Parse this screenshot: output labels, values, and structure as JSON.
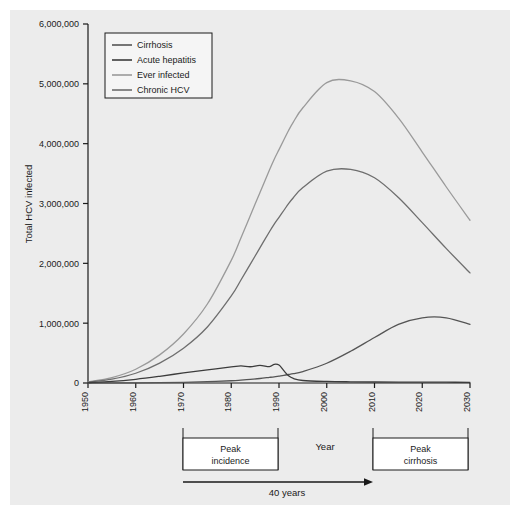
{
  "figure": {
    "background": "#ececec",
    "page_background": "#ffffff",
    "caption": ""
  },
  "chart_data": {
    "type": "line",
    "title": "",
    "xlabel": "Year",
    "ylabel": "Total HCV infected",
    "xlim": [
      1950,
      2030
    ],
    "ylim": [
      0,
      6000000
    ],
    "grid": false,
    "legend_position": "top-left inside",
    "xticks": [
      "1950",
      "1960",
      "1970",
      "1980",
      "1990",
      "2000",
      "2010",
      "2020",
      "2030"
    ],
    "xtick_values": [
      1950,
      1960,
      1970,
      1980,
      1990,
      2000,
      2010,
      2020,
      2030
    ],
    "yticks": [
      "0",
      "1,000,000",
      "2,000,000",
      "3,000,000",
      "4,000,000",
      "5,000,000",
      "6,000,000"
    ],
    "ytick_values": [
      0,
      1000000,
      2000000,
      3000000,
      4000000,
      5000000,
      6000000
    ],
    "x": [
      1950,
      1955,
      1960,
      1965,
      1970,
      1975,
      1980,
      1982,
      1984,
      1986,
      1988,
      1989,
      1990,
      1991,
      1992,
      1993,
      1995,
      2000,
      2005,
      2010,
      2015,
      2020,
      2025,
      2030
    ],
    "series": [
      {
        "name": "Ever infected",
        "color": "#9a9a9a",
        "width": 1.3,
        "values": [
          20000,
          90000,
          230000,
          470000,
          820000,
          1320000,
          2050000,
          2420000,
          2800000,
          3180000,
          3560000,
          3740000,
          3900000,
          4060000,
          4220000,
          4360000,
          4600000,
          5020000,
          5050000,
          4870000,
          4430000,
          3860000,
          3280000,
          2720000
        ]
      },
      {
        "name": "Chronic HCV",
        "color": "#6e6e6e",
        "width": 1.3,
        "values": [
          14000,
          64000,
          163000,
          333000,
          582000,
          937000,
          1455000,
          1718000,
          1988000,
          2258000,
          2528000,
          2655000,
          2769000,
          2883000,
          2997000,
          3096000,
          3266000,
          3540000,
          3570000,
          3430000,
          3100000,
          2680000,
          2250000,
          1840000
        ]
      },
      {
        "name": "Cirrhosis",
        "color": "#555555",
        "width": 1.3,
        "values": [
          0,
          1000,
          3000,
          6000,
          12000,
          22000,
          38000,
          48000,
          60000,
          75000,
          94000,
          104000,
          116000,
          128000,
          142000,
          157000,
          192000,
          330000,
          530000,
          760000,
          980000,
          1090000,
          1090000,
          980000
        ]
      },
      {
        "name": "Acute hepatitis",
        "color": "#3c3c3c",
        "width": 1.3,
        "values": [
          6000,
          26000,
          62000,
          112000,
          168000,
          220000,
          268000,
          286000,
          272000,
          296000,
          274000,
          312000,
          300000,
          206000,
          120000,
          76000,
          42000,
          26000,
          20000,
          17000,
          15000,
          14000,
          13000,
          12000
        ]
      }
    ],
    "legend": [
      {
        "label": "Cirrhosis",
        "color": "#555555"
      },
      {
        "label": "Acute hepatitis",
        "color": "#3c3c3c"
      },
      {
        "label": "Ever infected",
        "color": "#9a9a9a"
      },
      {
        "label": "Chronic HCV",
        "color": "#6e6e6e"
      }
    ]
  },
  "annotations": {
    "peak_incidence": {
      "line1": "Peak",
      "line2": "incidence",
      "from_year": 1970,
      "to_year": 1990
    },
    "peak_cirrhosis": {
      "line1": "Peak",
      "line2": "cirrhosis",
      "from_year": 2010,
      "to_year": 2030
    },
    "axis_center_label": "Year",
    "arrow_label": "40 years"
  }
}
